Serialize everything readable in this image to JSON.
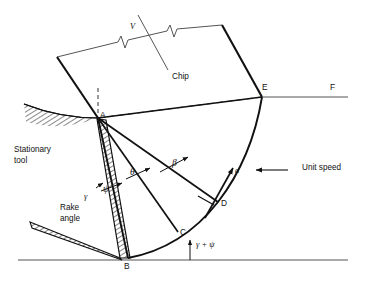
{
  "figure": {
    "type": "orthogonal-metal-cutting-slip-line-field-diagram",
    "background_color": "#ffffff",
    "line_color": "#111111",
    "thin_line_color": "#555555"
  },
  "labels": {
    "chip": "Chip",
    "stationary_tool": "Stationary\ntool",
    "stationary_tool_line1": "Stationary",
    "stationary_tool_line2": "tool",
    "rake_angle": "Rake\nangle",
    "rake_angle_line1": "Rake",
    "rake_angle_line2": "angle",
    "unit_speed": "Unit speed",
    "chip_velocity": "V"
  },
  "points": [
    {
      "id": "A",
      "label": "A",
      "x": 98,
      "y": 118,
      "role": "tool-tip-fan-center"
    },
    {
      "id": "B",
      "label": "B",
      "x": 128,
      "y": 258,
      "role": "baseline-vertex"
    },
    {
      "id": "C",
      "label": "C",
      "x": 178,
      "y": 232,
      "role": "arc-node"
    },
    {
      "id": "D",
      "label": "D",
      "x": 218,
      "y": 202,
      "role": "arc-node"
    },
    {
      "id": "E",
      "label": "E",
      "x": 262,
      "y": 97,
      "role": "chip-exit-vertex"
    },
    {
      "id": "F",
      "label": "F",
      "x": 330,
      "y": 86,
      "role": "free-surface-end"
    }
  ],
  "angles": [
    {
      "id": "gamma",
      "symbol": "γ",
      "name": "rake-angle",
      "x": 86,
      "y": 196
    },
    {
      "id": "psi",
      "symbol": "ψ",
      "name": "psi-angle",
      "x": 106,
      "y": 188
    },
    {
      "id": "theta",
      "symbol": "θ",
      "name": "theta-angle",
      "x": 131,
      "y": 172
    },
    {
      "id": "beta",
      "symbol": "β",
      "name": "beta-angle",
      "x": 172,
      "y": 163
    },
    {
      "id": "gamma_plus_psi",
      "symbol": "γ + ψ",
      "name": "gamma-plus-psi",
      "x": 205,
      "y": 246
    }
  ],
  "vectors": [
    {
      "id": "a",
      "symbol": "a",
      "name": "velocity-a",
      "x": 236,
      "y": 172
    },
    {
      "id": "unit_speed",
      "symbol": "Unit speed",
      "name": "unit-speed-arrow",
      "x": 297,
      "y": 167
    }
  ]
}
